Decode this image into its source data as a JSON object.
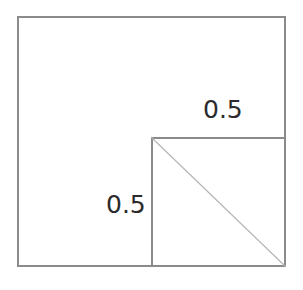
{
  "figure": {
    "background_color": "#ffffff",
    "line_color": "#8b8b8b",
    "diagonal_color": "#b4b4b4",
    "label_color": "#2b2b2b",
    "shapes": {
      "outer_rectangle": {
        "name": "outer-rectangle",
        "x": 17,
        "y": 16,
        "width": 269,
        "height": 251,
        "stroke": "#8b8b8b",
        "stroke_width": 2,
        "fill": "none"
      },
      "inner_square": {
        "name": "inner-square",
        "x": 151,
        "y": 137,
        "width": 135,
        "height": 130,
        "stroke": "#8b8b8b",
        "stroke_width": 2,
        "fill": "none"
      },
      "diagonal": {
        "name": "inner-square-diagonal",
        "x1": 0,
        "y1": 0,
        "x2": 135,
        "y2": 130,
        "stroke": "#b4b4b4",
        "stroke_width": 1
      }
    },
    "labels": {
      "top": "0.5",
      "left": "0.5"
    }
  }
}
